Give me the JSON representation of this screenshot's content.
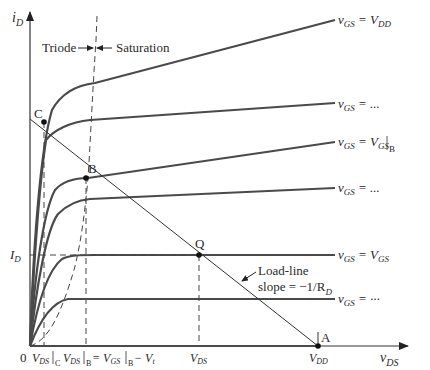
{
  "figure": {
    "type": "MOSFET output characteristics with load line",
    "axes": {
      "y_label": "i",
      "y_label_sub": "D",
      "x_label": "v",
      "x_label_sub": "DS",
      "origin": "0"
    },
    "regions": {
      "triode": "Triode",
      "saturation": "Saturation"
    },
    "curves": [
      {
        "label_pre": "v",
        "label_sub1": "GS",
        "label_eq": " = V",
        "label_sub2": "DD",
        "label_tail": ""
      },
      {
        "label_pre": "v",
        "label_sub1": "GS",
        "label_eq": " = ...",
        "label_sub2": "",
        "label_tail": ""
      },
      {
        "label_pre": "v",
        "label_sub1": "GS",
        "label_eq": " = V",
        "label_sub2": "GS",
        "label_tail": "B"
      },
      {
        "label_pre": "v",
        "label_sub1": "GS",
        "label_eq": " = ...",
        "label_sub2": "",
        "label_tail": ""
      },
      {
        "label_pre": "v",
        "label_sub1": "GS",
        "label_eq": " = V",
        "label_sub2": "GS",
        "label_tail": ""
      },
      {
        "label_pre": "v",
        "label_sub1": "GS",
        "label_eq": " = ···",
        "label_sub2": "",
        "label_tail": ""
      }
    ],
    "points": {
      "A": "A",
      "B": "B",
      "C": "C",
      "Q": "Q"
    },
    "load_line": {
      "line1": "Load-line",
      "line2_pre": "slope = −1/R",
      "line2_sub": "D"
    },
    "y_ticks": {
      "id_main": "I",
      "id_sub": "D"
    },
    "x_ticks": {
      "vds_c_main": "V",
      "vds_c_sub": "DS",
      "vds_c_tail": "C",
      "vds_b_main": "V",
      "vds_b_sub": "DS",
      "vds_b_tail": "B",
      "vds_b_eq": " = V",
      "vds_b_eq_sub": "GS",
      "vds_b_eq_tail": "B",
      "vds_b_minus": " − V",
      "vds_b_minus_sub": "t",
      "vds_main": "V",
      "vds_sub": "DS",
      "vdd_main": "V",
      "vdd_sub": "DD"
    },
    "colors": {
      "curve": "#4a4a4a",
      "axis": "#333333",
      "text": "#2a2a2a",
      "background": "#ffffff"
    }
  }
}
